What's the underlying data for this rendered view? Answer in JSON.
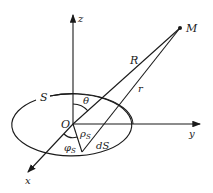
{
  "diagram": {
    "type": "coordinate-geometry",
    "labels": {
      "z_axis": "z",
      "y_axis": "y",
      "x_axis": "x",
      "origin": "O",
      "surface": "S",
      "point": "M",
      "distance_origin": "R",
      "distance_element": "r",
      "polar_angle": "θ",
      "radial": "ρ",
      "radial_sub": "S",
      "azimuth": "φ",
      "azimuth_sub": "S",
      "element": "dS"
    },
    "colors": {
      "line": "#1a1a1a",
      "background": "#ffffff"
    }
  }
}
